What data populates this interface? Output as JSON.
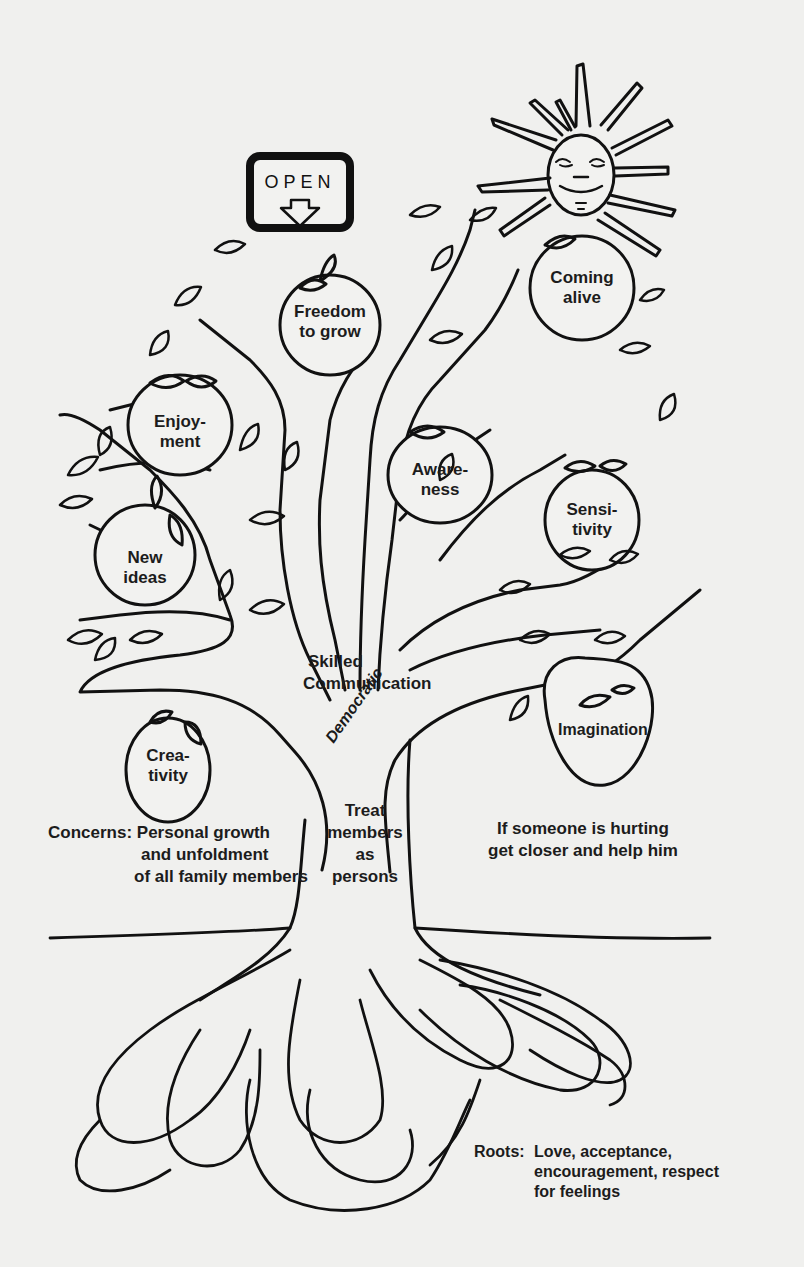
{
  "diagram": {
    "open_sign": {
      "label": "OPEN",
      "icon": "arrow-down-icon"
    },
    "sun": {
      "icon": "smiling-sun-icon"
    },
    "fruits": [
      {
        "id": "freedom",
        "line1": "Freedom",
        "line2": "to grow"
      },
      {
        "id": "coming-alive",
        "line1": "Coming",
        "line2": "alive"
      },
      {
        "id": "enjoyment",
        "line1": "Enjoy-",
        "line2": "ment"
      },
      {
        "id": "awareness",
        "line1": "Aware-",
        "line2": "ness"
      },
      {
        "id": "sensitivity",
        "line1": "Sensi-",
        "line2": "tivity"
      },
      {
        "id": "new-ideas",
        "line1": "New",
        "line2": "ideas"
      },
      {
        "id": "creativity",
        "line1": "Crea-",
        "line2": "tivity"
      },
      {
        "id": "imagination",
        "line1": "Imagination",
        "line2": ""
      }
    ],
    "trunk_labels": {
      "skilled": "Skilled",
      "communication": "Communication",
      "democratic": "Democratic",
      "treat1": "Treat",
      "treat2": "members",
      "treat3": "as",
      "treat4": "persons"
    },
    "concerns": {
      "line1": "Concerns: Personal growth",
      "line2": "and unfoldment",
      "line3": "of all family members"
    },
    "hurting": {
      "line1": "If someone is hurting",
      "line2": "get closer and help him"
    },
    "roots": {
      "prefix": "Roots:",
      "line1": "Love, acceptance,",
      "line2": "encouragement, respect",
      "line3": "for feelings"
    }
  }
}
